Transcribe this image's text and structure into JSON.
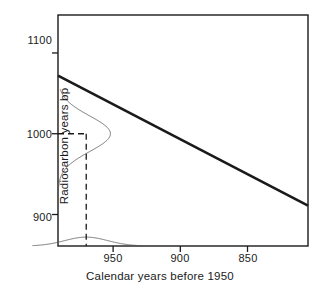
{
  "chart_data": {
    "type": "line",
    "title": "",
    "subtitle": "",
    "xlabel": "Calendar years before 1950",
    "ylabel": "Radiocarbon years bp",
    "xlim": [
      991,
      805
    ],
    "ylim": [
      861,
      1147
    ],
    "x_axis_reversed": true,
    "grid": false,
    "legend": null,
    "xticks": [
      950,
      900,
      850
    ],
    "xtick_labels": [
      "950",
      "900",
      "850"
    ],
    "yticks": [
      1100,
      1000,
      900
    ],
    "ytick_labels": [
      "1100",
      "1000",
      "900"
    ],
    "series": [
      {
        "name": "Calibration curve",
        "type": "line",
        "style": "solid",
        "linewidth": 2.6,
        "color": "#1a1a1a",
        "x": [
          991,
          805
        ],
        "values": [
          1072,
          911
        ],
        "description": "Straight descending calibration line from upper-left to lower-right"
      },
      {
        "name": "Radiocarbon determination distribution",
        "type": "density-vertical",
        "style": "solid",
        "linewidth": 0.8,
        "color": "#555555",
        "axis": "y",
        "mean": 1000,
        "sigma": 22,
        "range": [
          930,
          1055
        ],
        "peak_extent_years": 39,
        "description": "Gaussian probability density drawn sideways against the y-axis, centred on 1000 bp"
      },
      {
        "name": "Calibrated calendar age distribution",
        "type": "density-horizontal",
        "style": "solid",
        "linewidth": 0.8,
        "color": "#555555",
        "axis": "x",
        "mean": 970,
        "sigma": 16,
        "range": [
          1010,
          928
        ],
        "peak_extent_years": 11,
        "description": "Gaussian probability density drawn along the x-axis, centred on 970 calendar years before 1950"
      }
    ],
    "annotations": [
      {
        "name": "projection-horizontal",
        "type": "dashed-line",
        "orientation": "horizontal",
        "y": 1000,
        "x_from": 991,
        "x_to": 970,
        "color": "#1a1a1a",
        "description": "Dashed horizontal guide at 1000 radiocarbon years bp running to the calibration curve"
      },
      {
        "name": "projection-vertical",
        "type": "dashed-line",
        "orientation": "vertical",
        "x": 970,
        "y_from": 1000,
        "y_to": 861,
        "color": "#1a1a1a",
        "description": "Dashed vertical guide dropping from the calibration curve to the calendar axis at 970"
      },
      {
        "name": "intersection-point",
        "type": "point",
        "x": 970,
        "y": 1000,
        "description": "Intersection of the 1000 bp level with the calibration curve"
      }
    ],
    "frame": {
      "box": true,
      "color": "#1a1a1a",
      "linewidth": 1.4
    }
  },
  "figure": {
    "background_color": "#ffffff",
    "axis_color": "#1a1a1a",
    "curve_color": "#555555",
    "calibration_color": "#1a1a1a"
  }
}
